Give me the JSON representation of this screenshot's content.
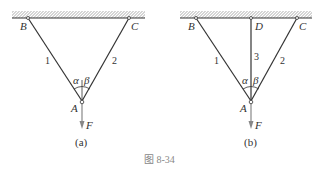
{
  "figure": {
    "caption": "图 8-34",
    "colors": {
      "line": "#333333",
      "arrow": "#888888",
      "caption": "#888888"
    }
  },
  "diagrams": [
    {
      "id": "a",
      "sublabel": "(a)",
      "points": {
        "B": "B",
        "C": "C",
        "A": "A"
      },
      "bars": [
        "1",
        "2"
      ],
      "angles": {
        "left": "α",
        "right": "β"
      },
      "force": "F"
    },
    {
      "id": "b",
      "sublabel": "(b)",
      "points": {
        "B": "B",
        "C": "C",
        "D": "D",
        "A": "A"
      },
      "bars": [
        "1",
        "3",
        "2"
      ],
      "angles": {
        "left": "α",
        "right": "β"
      },
      "force": "F"
    }
  ]
}
